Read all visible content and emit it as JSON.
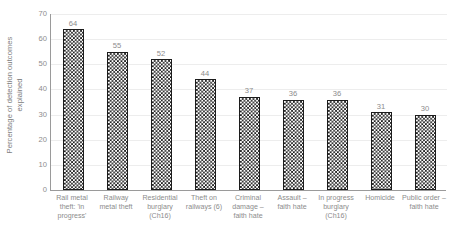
{
  "chart_data": {
    "type": "bar",
    "title": "",
    "subtitle": "",
    "xlabel": "",
    "ylabel": "Percentage of detection outcomes explained",
    "ylim": [
      0,
      70
    ],
    "yticks": [
      0,
      10,
      20,
      30,
      40,
      50,
      60,
      70
    ],
    "ytick_labels": [
      "0",
      "10",
      "20",
      "30",
      "40",
      "50",
      "60",
      "70"
    ],
    "grid": true,
    "grid_axis": "y",
    "legend": false,
    "legend_position": "none",
    "bar_fill": "checkerboard",
    "categories": [
      "Rail metal theft: 'in progress'",
      "Railway metal theft",
      "Residential burglary (Ch16)",
      "Theft on railways (6)",
      "Criminal damage – faith hate",
      "Assault – faith hate",
      "In progress burglary (Ch16)",
      "Homicide",
      "Public order – faith hate"
    ],
    "values": [
      64,
      55,
      52,
      44,
      37,
      36,
      36,
      31,
      30
    ],
    "data_labels": [
      "64",
      "55",
      "52",
      "44",
      "37",
      "36",
      "36",
      "31",
      "30"
    ]
  },
  "axis_title": {
    "line1": "Percentage of detection outcomes",
    "line2": "explained"
  },
  "colors": {
    "bar_pattern_dark": "#1c1c1c",
    "bar_pattern_light": "#ffffff",
    "bar_border": "#1c1c1c",
    "axis_line": "#9a9a9a",
    "gridline": "#ededed",
    "text": "#8c8c8c",
    "background": "#ffffff"
  }
}
